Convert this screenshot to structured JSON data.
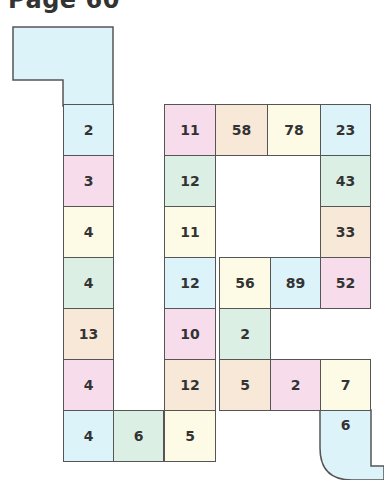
{
  "page_title": "Page 60",
  "colors": {
    "blue": "#dcf3f9",
    "pink": "#f7dcec",
    "yellow": "#fdfbe6",
    "green": "#dcefe4",
    "peach": "#f8e8d8",
    "border": "#555555"
  },
  "board": {
    "start_region": {
      "label": "",
      "color": "blue"
    },
    "end_region": {
      "label": "",
      "color": "blue"
    },
    "cells": [
      {
        "value": "2",
        "color": "blue"
      },
      {
        "value": "3",
        "color": "pink"
      },
      {
        "value": "4",
        "color": "yellow"
      },
      {
        "value": "4",
        "color": "green"
      },
      {
        "value": "13",
        "color": "peach"
      },
      {
        "value": "4",
        "color": "pink"
      },
      {
        "value": "4",
        "color": "blue"
      },
      {
        "value": "6",
        "color": "green"
      },
      {
        "value": "5",
        "color": "yellow"
      },
      {
        "value": "12",
        "color": "peach"
      },
      {
        "value": "10",
        "color": "pink"
      },
      {
        "value": "12",
        "color": "blue"
      },
      {
        "value": "11",
        "color": "yellow"
      },
      {
        "value": "12",
        "color": "green"
      },
      {
        "value": "11",
        "color": "pink"
      },
      {
        "value": "58",
        "color": "peach"
      },
      {
        "value": "78",
        "color": "yellow"
      },
      {
        "value": "23",
        "color": "blue"
      },
      {
        "value": "43",
        "color": "green"
      },
      {
        "value": "33",
        "color": "peach"
      },
      {
        "value": "52",
        "color": "pink"
      },
      {
        "value": "89",
        "color": "blue"
      },
      {
        "value": "56",
        "color": "yellow"
      },
      {
        "value": "2",
        "color": "green"
      },
      {
        "value": "5",
        "color": "peach"
      },
      {
        "value": "2",
        "color": "pink"
      },
      {
        "value": "7",
        "color": "yellow"
      },
      {
        "value": "6",
        "color": "blue"
      }
    ]
  }
}
